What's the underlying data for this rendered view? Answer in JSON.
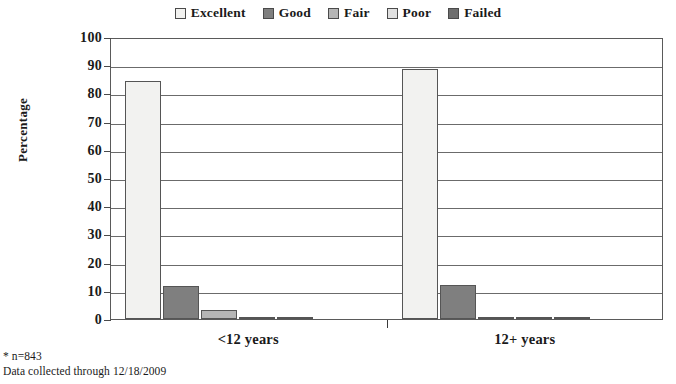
{
  "chart_data": {
    "type": "bar",
    "title": "",
    "xlabel": "",
    "ylabel": "Percentage",
    "ylim": [
      0,
      100
    ],
    "ytick_step": 10,
    "grid": true,
    "legend_position": "top-center",
    "categories": [
      "<12 years",
      "12+ years"
    ],
    "yticks": [
      "100",
      "90",
      "80",
      "70",
      "60",
      "50",
      "40",
      "30",
      "20",
      "10",
      "0"
    ],
    "series": [
      {
        "name": "Excellent",
        "color": "#f2f2f0",
        "values": [
          84.5,
          88.7
        ]
      },
      {
        "name": "Good",
        "color": "#7f7f7f",
        "values": [
          11.6,
          11.9
        ]
      },
      {
        "name": "Fair",
        "color": "#b5b5b5",
        "values": [
          3.3,
          0.5
        ]
      },
      {
        "name": "Poor",
        "color": "#e0e0e0",
        "values": [
          0.5,
          0.3
        ]
      },
      {
        "name": "Failed",
        "color": "#6e6e6e",
        "values": [
          0.7,
          0.4
        ]
      }
    ],
    "annotations": [
      "* n=843",
      "Data collected through 12/18/2009"
    ]
  },
  "legend": {
    "items": [
      {
        "label": "Excellent"
      },
      {
        "label": "Good"
      },
      {
        "label": "Fair"
      },
      {
        "label": "Poor"
      },
      {
        "label": "Failed"
      }
    ]
  },
  "footnotes": {
    "sample_size": "* n=843",
    "collection": "Data collected through 12/18/2009"
  }
}
